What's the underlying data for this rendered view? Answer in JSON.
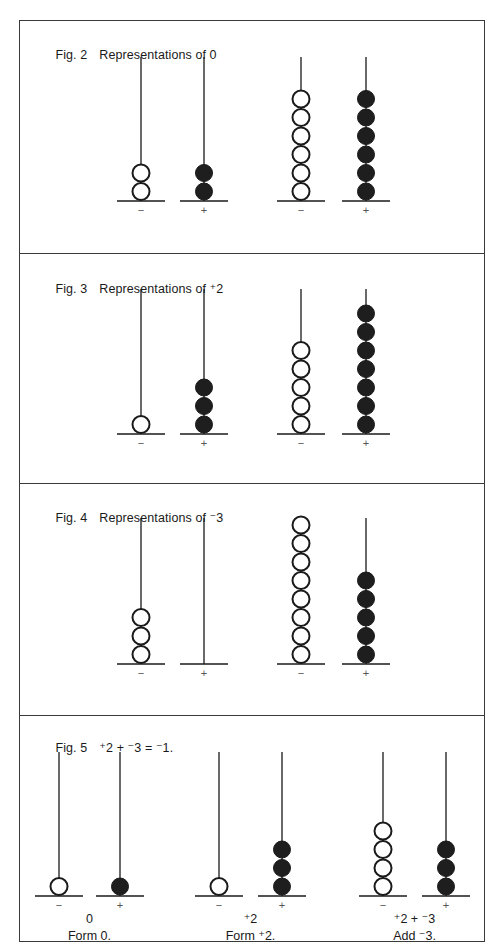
{
  "colors": {
    "ink": "#1a1a1a",
    "border": "#3a3a3a",
    "bead_filled": "#1e1e1e",
    "bead_open_fill": "#ffffff",
    "sign": "#555555"
  },
  "figures": [
    {
      "number": "Fig. 2",
      "title": "Representations of 0",
      "groups": [
        {
          "minus_beads": 2,
          "plus_beads": 2,
          "minus_sign": "−",
          "plus_sign": "+"
        },
        {
          "minus_beads": 6,
          "plus_beads": 6,
          "minus_sign": "−",
          "plus_sign": "+"
        }
      ]
    },
    {
      "number": "Fig. 3",
      "title": "Representations of ⁺2",
      "groups": [
        {
          "minus_beads": 1,
          "plus_beads": 3,
          "minus_sign": "−",
          "plus_sign": "+"
        },
        {
          "minus_beads": 5,
          "plus_beads": 7,
          "minus_sign": "−",
          "plus_sign": "+"
        }
      ]
    },
    {
      "number": "Fig. 4",
      "title": "Representations of ⁻3",
      "groups": [
        {
          "minus_beads": 3,
          "plus_beads": 0,
          "minus_sign": "−",
          "plus_sign": "+"
        },
        {
          "minus_beads": 8,
          "plus_beads": 5,
          "minus_sign": "−",
          "plus_sign": "+"
        }
      ]
    },
    {
      "number": "Fig. 5",
      "title": "⁺2 + ⁻3 = ⁻1.",
      "groups": [
        {
          "minus_beads": 1,
          "plus_beads": 1,
          "minus_sign": "−",
          "plus_sign": "+",
          "value": "0",
          "caption": "Form 0."
        },
        {
          "minus_beads": 1,
          "plus_beads": 3,
          "minus_sign": "−",
          "plus_sign": "+",
          "value": "⁺2",
          "caption": "Form ⁺2."
        },
        {
          "minus_beads": 4,
          "plus_beads": 3,
          "minus_sign": "−",
          "plus_sign": "+",
          "value": "⁺2 + ⁻3",
          "caption": "Add ⁻3."
        }
      ]
    }
  ]
}
